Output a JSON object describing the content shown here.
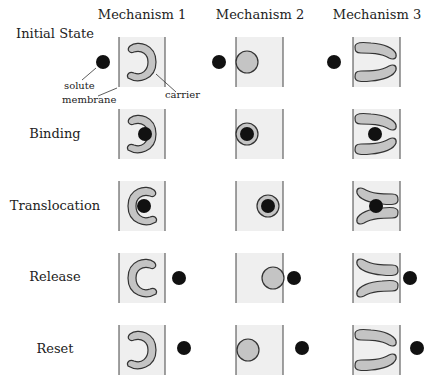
{
  "columns": [
    {
      "label": "Mechanism 1"
    },
    {
      "label": "Mechanism 2"
    },
    {
      "label": "Mechanism 3"
    }
  ],
  "rows": [
    {
      "label": "Initial State"
    },
    {
      "label": "Binding"
    },
    {
      "label": "Translocation"
    },
    {
      "label": "Release"
    },
    {
      "label": "Reset"
    }
  ],
  "annotations": {
    "solute": "solute",
    "membrane": "membrane",
    "carrier": "carrier"
  },
  "colors": {
    "membrane_fill": "#efefef",
    "carrier_fill": "#c4c4c4",
    "solute_fill": "#111111",
    "outline": "#333333"
  }
}
